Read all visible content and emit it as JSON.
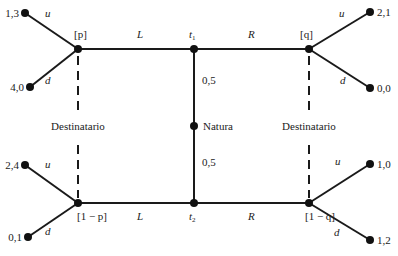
{
  "diagram": {
    "type": "signaling-game-tree",
    "nature": {
      "label": "Natura",
      "prob_top": "0,5",
      "prob_bottom": "0,5"
    },
    "types": {
      "top": "t",
      "top_sub": "1",
      "bottom": "t",
      "bottom_sub": "2"
    },
    "sender_actions": {
      "left": "L",
      "right": "R"
    },
    "beliefs": {
      "top_left": "[p]",
      "bottom_left": "[1 − p]",
      "top_right": "[q]",
      "bottom_right": "[1 − q]"
    },
    "receiver_label_left": "Destinatario",
    "receiver_label_right": "Destinatario",
    "receiver_actions": {
      "up": "u",
      "down": "d"
    },
    "payoffs": {
      "top_left_u": "1,3",
      "top_left_d": "4,0",
      "top_right_u": "2,1",
      "top_right_d": "0,0",
      "bottom_left_u": "2,4",
      "bottom_left_d": "0,1",
      "bottom_right_u": "1,0",
      "bottom_right_d": "1,2"
    }
  }
}
